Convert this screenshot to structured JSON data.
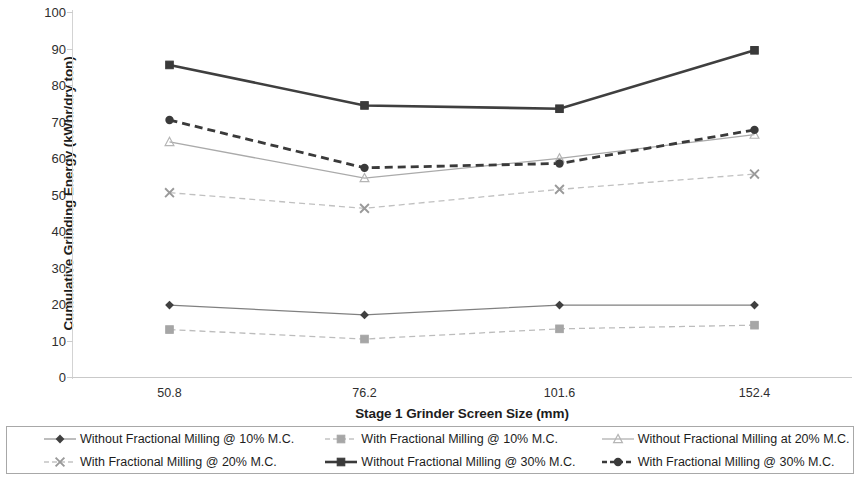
{
  "chart_data": {
    "type": "line",
    "title": "",
    "xlabel": "Stage 1 Grinder Screen Size (mm)",
    "ylabel": "Cumulative Grinding Energy (kWhr/dry ton)",
    "categories": [
      "50.8",
      "76.2",
      "101.6",
      "152.4"
    ],
    "ylim": [
      0,
      100
    ],
    "ytick_step": 10,
    "yticks": [
      "100",
      "90",
      "80",
      "70",
      "60",
      "50",
      "40",
      "30",
      "20",
      "10",
      "0"
    ],
    "grid": false,
    "legend_position": "bottom",
    "series": [
      {
        "name": "Without Fractional Milling @ 10% M.C.",
        "marker": "diamond",
        "line_style": "solid",
        "color": "#808080",
        "marker_color": "#404040",
        "values": [
          19.7,
          17.0,
          19.7,
          19.7
        ]
      },
      {
        "name": "With Fractional Milling @ 10% M.C.",
        "marker": "square",
        "line_style": "dashed",
        "color": "#bcbcbc",
        "marker_color": "#a6a6a6",
        "values": [
          13.0,
          10.4,
          13.2,
          14.2
        ]
      },
      {
        "name": "Without Fractional Milling at 20% M.C.",
        "marker": "triangle",
        "line_style": "solid",
        "color": "#aaaaaa",
        "marker_color": "#b5b5b5",
        "values": [
          64.4,
          54.5,
          59.9,
          66.4
        ]
      },
      {
        "name": "With Fractional Milling @ 20% M.C.",
        "marker": "x",
        "line_style": "dashed",
        "color": "#c0c0c0",
        "marker_color": "#9a9a9a",
        "values": [
          50.5,
          46.2,
          51.4,
          55.6
        ]
      },
      {
        "name": "Without Fractional Milling @ 30% M.C.",
        "marker": "square",
        "line_style": "solid",
        "color": "#3f3f3f",
        "marker_color": "#3a3a3a",
        "values": [
          85.5,
          74.4,
          73.5,
          89.5
        ]
      },
      {
        "name": "With Fractional Milling @ 30% M.C.",
        "marker": "circle",
        "line_style": "dashed",
        "color": "#3a3a3a",
        "marker_color": "#3a3a3a",
        "values": [
          70.4,
          57.3,
          58.5,
          67.7
        ]
      }
    ]
  },
  "legend": {
    "row1": [
      "Without Fractional Milling @ 10% M.C.",
      "With Fractional Milling @ 10% M.C.",
      "Without Fractional Milling at 20% M.C."
    ],
    "row2": [
      "With Fractional Milling @ 20% M.C.",
      "Without Fractional Milling @ 30% M.C.",
      "With Fractional Milling @ 30% M.C."
    ]
  }
}
